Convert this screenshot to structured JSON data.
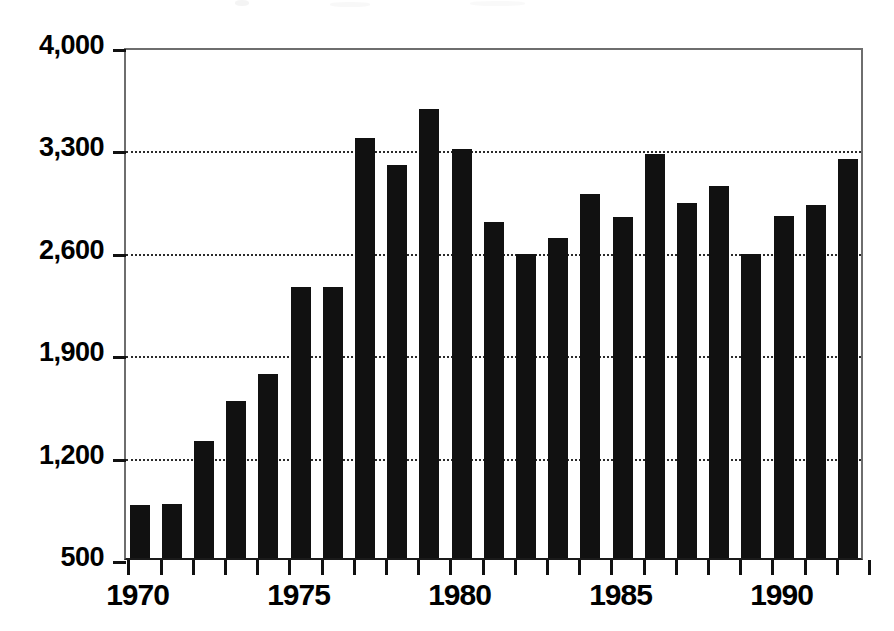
{
  "chart_data": {
    "type": "bar",
    "title": "",
    "subtitle": "",
    "xlabel": "",
    "ylabel": "",
    "categories": [
      "1970",
      "1971",
      "1972",
      "1973",
      "1974",
      "1975",
      "1976",
      "1977",
      "1978",
      "1979",
      "1980",
      "1981",
      "1982",
      "1983",
      "1984",
      "1985",
      "1986",
      "1987",
      "1988",
      "1989",
      "1990",
      "1991",
      "1992"
    ],
    "values": [
      863,
      870,
      1300,
      1575,
      1760,
      2355,
      2350,
      3370,
      3185,
      3570,
      3295,
      2795,
      2580,
      2685,
      2985,
      2830,
      3260,
      2925,
      3045,
      2575,
      2840,
      2915,
      3230
    ],
    "ylim": [
      500,
      4000
    ],
    "xlim": [
      "1970",
      "1992"
    ],
    "y_tick_labels": [
      "500",
      "1,200",
      "1,900",
      "2,600",
      "3,300",
      "4,000"
    ],
    "y_tick_values": [
      500,
      1200,
      1900,
      2600,
      3300,
      4000
    ],
    "x_tick_labels": [
      "1970",
      "1975",
      "1980",
      "1985",
      "1990"
    ],
    "x_tick_values": [
      "1970",
      "1975",
      "1980",
      "1985",
      "1990"
    ],
    "grid": true,
    "grid_axis": "y",
    "legend": null,
    "legend_position": "none",
    "bar_color": "#111111",
    "axis_color": "#6e6e6e",
    "grid_color": "#2b2b2b",
    "background_color": "#ffffff",
    "annotations": []
  },
  "figure": {
    "width": 894,
    "height": 631
  }
}
